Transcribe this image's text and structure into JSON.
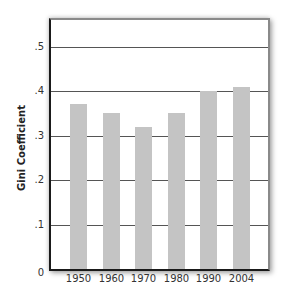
{
  "chart_data": {
    "type": "bar",
    "title": "",
    "xlabel": "",
    "ylabel": "Gini Coefficient",
    "categories": [
      "1950",
      "1960",
      "1970",
      "1980",
      "1990",
      "2004"
    ],
    "values": [
      0.37,
      0.35,
      0.32,
      0.35,
      0.4,
      0.41
    ],
    "ylim": [
      0,
      0.57
    ],
    "yticks": [
      0,
      0.1,
      0.2,
      0.3,
      0.4,
      0.5
    ],
    "ytick_labels": [
      "0",
      ".1",
      ".2",
      ".3",
      ".4",
      ".5"
    ],
    "grid": true,
    "legend": null,
    "colors": {
      "bar": "#c4c4c4",
      "gridline": "#555555",
      "axis": "#1a1a1a"
    }
  }
}
